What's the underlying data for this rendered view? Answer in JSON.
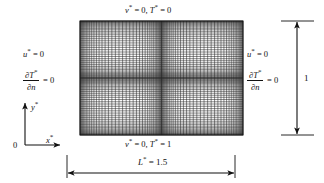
{
  "boundary_conditions": {
    "top": {
      "var1": "v",
      "star1": "*",
      "eq1": "= 0,",
      "var2": "T",
      "star2": "*",
      "eq2": "= 0"
    },
    "bottom": {
      "var1": "v",
      "star1": "*",
      "eq1": "= 0,",
      "var2": "T",
      "star2": "*",
      "eq2": "= 1"
    },
    "left": {
      "line1_var": "u",
      "line1_star": "*",
      "line1_eq": "= 0",
      "frac_num": "∂T",
      "frac_num_star": "*",
      "frac_den": "∂n",
      "frac_eq": "= 0"
    },
    "right": {
      "line1_var": "u",
      "line1_star": "*",
      "line1_eq": "= 0",
      "frac_num": "∂T",
      "frac_num_star": "*",
      "frac_den": "∂n",
      "frac_eq": "= 0"
    }
  },
  "dimensions": {
    "width_var": "L",
    "width_star": "*",
    "width_value": "= 1.5",
    "height_value": "1"
  },
  "axes": {
    "origin": "0",
    "x_label": "x",
    "x_star": "*",
    "y_label": "y",
    "y_star": "*"
  },
  "mesh": {
    "x_left": 80,
    "x_right": 243,
    "y_top": 21,
    "y_bottom": 135,
    "vertical_lines": [
      80.0,
      80.9,
      81.9,
      83.1,
      84.5,
      86.1,
      88.0,
      90.2,
      92.7,
      95.6,
      98.8,
      102.4,
      106.4,
      110.7,
      115.4,
      120.4,
      125.7,
      131.2,
      136.9,
      142.7,
      148.5,
      154.3,
      160.0,
      165.5,
      170.8,
      175.8,
      180.5,
      184.8,
      188.8,
      192.4,
      195.6,
      198.5,
      201.0,
      203.2,
      205.1,
      206.7,
      208.1,
      209.3,
      210.3,
      211.1
    ],
    "horizontal_lines": [
      21.0,
      21.7,
      22.5,
      23.5,
      24.7,
      26.1,
      27.7,
      29.5,
      31.5,
      33.8,
      36.3,
      39.0,
      41.9,
      45.0,
      48.3,
      51.8,
      55.4,
      59.2,
      63.1,
      67.0,
      71.0,
      75.0,
      78.9,
      82.8,
      86.6,
      90.2,
      93.7,
      97.0,
      100.1,
      103.0,
      105.7,
      108.2,
      110.5,
      112.5,
      114.3,
      115.9,
      117.3,
      118.5,
      119.5,
      120.3
    ]
  },
  "colors": {
    "line": "#111111",
    "mesh": "#2a2a2a",
    "background": "#ffffff"
  }
}
